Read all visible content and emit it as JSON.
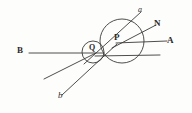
{
  "figure": {
    "kind": "geometry-diagram",
    "background_color": "#fdfdfc",
    "ink_color": "#3a3a38",
    "labels": {
      "point_p": "P",
      "point_q": "Q",
      "line_a_upper": "A",
      "line_b_left": "B",
      "normal_n": "N",
      "ray_a_italic": "a",
      "ray_b_italic": "b"
    }
  },
  "chart_data": {
    "type": "scatter",
    "title": "",
    "xlabel": "",
    "ylabel": "",
    "xlim": [
      0,
      192
    ],
    "ylim": [
      0,
      113
    ],
    "grid": false,
    "legend": "none",
    "circles": [
      {
        "name": "large-circle-at-P",
        "cx": 122,
        "cy": 41,
        "r": 22
      },
      {
        "name": "small-circle-at-Q",
        "cx": 93,
        "cy": 52,
        "r": 11
      }
    ],
    "points": [
      {
        "name": "P",
        "label": "P",
        "x": 122,
        "y": 41
      },
      {
        "name": "Q",
        "label": "Q",
        "x": 93,
        "y": 52
      }
    ],
    "lines": [
      {
        "name": "ray-A",
        "label": "A",
        "x1": 116,
        "y1": 43,
        "x2": 167,
        "y2": 41
      },
      {
        "name": "ray-B",
        "label": "B",
        "x1": 29,
        "y1": 53,
        "x2": 104,
        "y2": 53
      },
      {
        "name": "horizontal-lower-right",
        "label": "",
        "x1": 95,
        "y1": 56,
        "x2": 160,
        "y2": 55
      },
      {
        "name": "ray-N",
        "label": "N",
        "x1": 112,
        "y1": 48,
        "x2": 156,
        "y2": 25
      },
      {
        "name": "ray-a",
        "label": "a",
        "x1": 84,
        "y1": 64,
        "x2": 141,
        "y2": 12
      },
      {
        "name": "ray-b",
        "label": "b",
        "x1": 62,
        "y1": 95,
        "x2": 117,
        "y2": 44
      },
      {
        "name": "ray-lower-left",
        "label": "",
        "x1": 44,
        "y1": 79,
        "x2": 96,
        "y2": 53
      }
    ],
    "label_positions": [
      {
        "text": "a",
        "x": 138,
        "y": 7,
        "style": "italic"
      },
      {
        "text": "N",
        "x": 154,
        "y": 20,
        "style": "bold"
      },
      {
        "text": "A",
        "x": 167,
        "y": 37,
        "style": "bold"
      },
      {
        "text": "P",
        "x": 114,
        "y": 34,
        "style": "bold"
      },
      {
        "text": "Q",
        "x": 89,
        "y": 45,
        "style": "bold"
      },
      {
        "text": "B",
        "x": 17,
        "y": 47,
        "style": "bold"
      },
      {
        "text": "b",
        "x": 58,
        "y": 92,
        "style": "italic"
      }
    ]
  }
}
